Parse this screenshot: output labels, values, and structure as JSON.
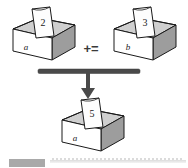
{
  "diagram": {
    "operator": "+=",
    "boxes": [
      {
        "id": "box-a-operand",
        "variable_label": "a",
        "card_value": "2",
        "role": "left operand"
      },
      {
        "id": "box-b-operand",
        "variable_label": "b",
        "card_value": "3",
        "role": "right operand"
      },
      {
        "id": "box-a-result",
        "variable_label": "a",
        "card_value": "5",
        "role": "result"
      }
    ],
    "arrow": {
      "name": "down-arrow",
      "direction": "down"
    },
    "bar": {
      "name": "horizontal-bar"
    },
    "colors": {
      "outline": "#1a1a1a",
      "box_front": "#ffffff",
      "box_side": "#9d9d9d",
      "box_inner": "#cfcfcf",
      "card": "#fdfdfd",
      "bar": "#4a4a4a",
      "arrow": "#4a4a4a",
      "background": "#ffffff"
    }
  },
  "footer": {
    "chip_label": "",
    "rule_label": ""
  }
}
